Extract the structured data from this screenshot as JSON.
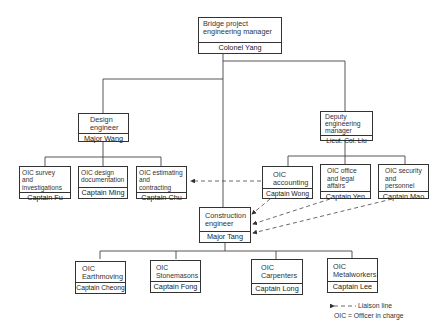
{
  "chart_title": "Bridge project organization chart",
  "top": {
    "title": "Bridge project engineering manager",
    "name": "Colonel Yang"
  },
  "design": {
    "title": "Design engineer",
    "name": "Major Wang"
  },
  "deputy": {
    "title": "Deputy engineering manager",
    "name": "Lieut. Col. Liu"
  },
  "design_units": [
    {
      "title": "OIC survey and investigations",
      "name": "Captain Fu"
    },
    {
      "title": "OIC design documentation",
      "name": "Captain Ming"
    },
    {
      "title": "OIC estimating and contracting",
      "name": "Captain Chu"
    }
  ],
  "deputy_units": [
    {
      "title": "OIC accounting",
      "name": "Captain Wong"
    },
    {
      "title": "OIC office and legal affairs",
      "name": "Captain Yen"
    },
    {
      "title": "OIC security and personnel",
      "name": "Captain Mao"
    }
  ],
  "construction": {
    "title": "Construction engineer",
    "name": "Major Tang"
  },
  "construction_units": [
    {
      "title": "OIC Earthmoving",
      "name": "Captain Cheong"
    },
    {
      "title": "OIC Stonemasons",
      "name": "Captain Fong"
    },
    {
      "title": "OIC Carpenters",
      "name": "Captain Long"
    },
    {
      "title": "OIC Metalworkers",
      "name": "Captain Lee"
    }
  ],
  "legend": {
    "liaison": "Liaison line",
    "oic": "OIC = Officer in charge"
  },
  "colors": {
    "line": "#333333",
    "text": "#222222",
    "background": "#ffffff"
  }
}
